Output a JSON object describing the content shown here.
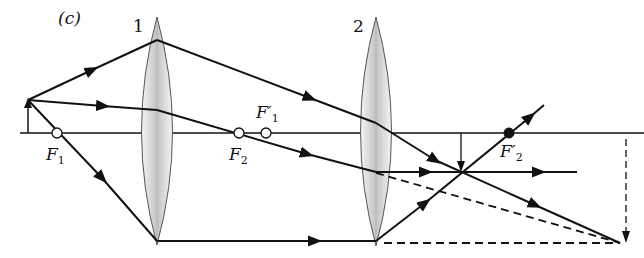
{
  "panel_label": "(c)",
  "lenses": [
    {
      "label": "1",
      "center_x": 157
    },
    {
      "label": "2",
      "center_x": 376
    }
  ],
  "focal_points": {
    "F1": {
      "letter": "F",
      "sub": "1",
      "prime": ""
    },
    "F2": {
      "letter": "F",
      "sub": "2",
      "prime": ""
    },
    "F1p": {
      "letter": "F",
      "sub": "1",
      "prime": "′"
    },
    "F2p": {
      "letter": "F",
      "sub": "2",
      "prime": "′"
    }
  },
  "colors": {
    "line": "#111111",
    "lens_edge": "#555555",
    "lens_fill": "#cfcfcf",
    "background": "#ffffff"
  }
}
